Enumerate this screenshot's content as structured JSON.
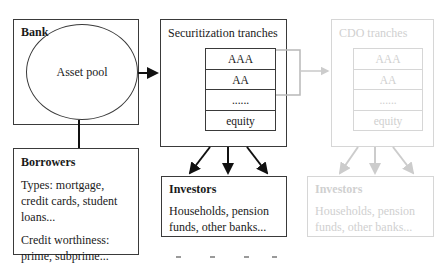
{
  "bank": {
    "title": "Bank",
    "asset_pool_label": "Asset pool"
  },
  "borrowers": {
    "title": "Borrowers",
    "lines": [
      "Types: mortgage, credit cards, student loans...",
      "Credit worthiness: prime, subprime..."
    ]
  },
  "securitization": {
    "title": "Securitization tranches",
    "tranches": [
      "AAA",
      "AA",
      "......",
      "equity"
    ]
  },
  "investors": {
    "title": "Investors",
    "text": "Households, pension funds, other banks..."
  },
  "cdo": {
    "title": "CDO tranches",
    "tranches": [
      "AAA",
      "AA",
      "......",
      "equity"
    ],
    "investors_title": "Investors",
    "investors_text": "Households, pension funds, other banks..."
  },
  "colors": {
    "primary_stroke": "#3a3a3a",
    "faded_stroke": "#d6d6d6",
    "faded_text": "#d0d0d0",
    "background": "#ffffff"
  }
}
